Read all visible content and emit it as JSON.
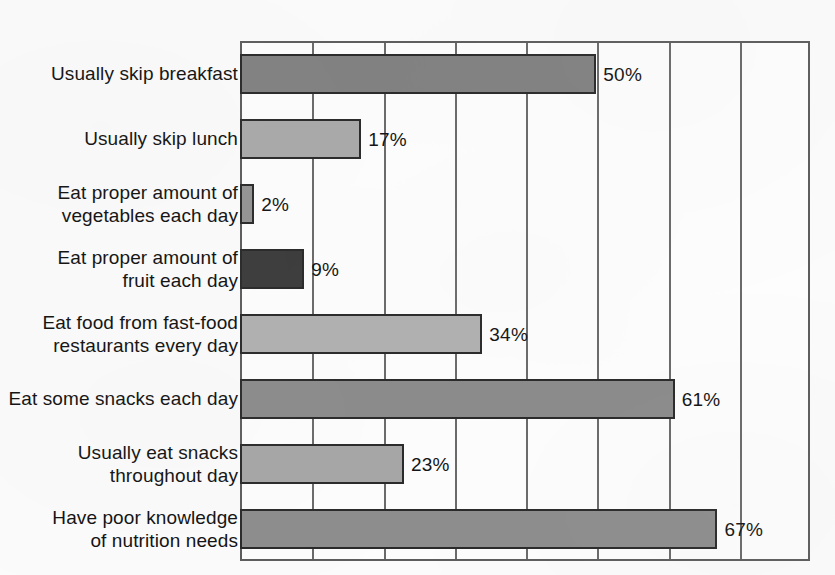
{
  "chart_data": {
    "type": "bar",
    "orientation": "horizontal",
    "title": "",
    "subtitle": "",
    "xlabel": "",
    "ylabel": "",
    "xlim": [
      0,
      80
    ],
    "ylim": null,
    "grid": true,
    "grid_axis": "x",
    "legend": false,
    "legend_position": "none",
    "x_tick_labels": [],
    "gridline_values": [
      0,
      10,
      20,
      30,
      40,
      50,
      60,
      70,
      80
    ],
    "categories": [
      "Usually skip breakfast",
      "Usually skip lunch",
      "Eat proper amount of\nvegetables each day",
      "Eat proper amount of\nfruit each day",
      "Eat food from fast-food\nrestaurants every day",
      "Eat some snacks each day",
      "Usually eat snacks\nthroughout day",
      "Have poor knowledge\nof nutrition needs"
    ],
    "values": [
      50,
      17,
      2,
      9,
      34,
      61,
      23,
      67
    ],
    "data_labels": [
      "50%",
      "17%",
      "2%",
      "9%",
      "34%",
      "61%",
      "23%",
      "67%"
    ],
    "bar_colors": [
      "#818181",
      "#a9a9a9",
      "#949494",
      "#3c3c3c",
      "#b0b0b0",
      "#8b8b8b",
      "#a6a6a6",
      "#8d8d8d"
    ],
    "bar_border_color": "#2a2a2a",
    "frame_color": "#5d5d5d",
    "grid_color": "#6a6a6a",
    "text_color": "#121212",
    "background_color": "#fbfbfb",
    "plot_background_color": "#fdfdfd"
  }
}
